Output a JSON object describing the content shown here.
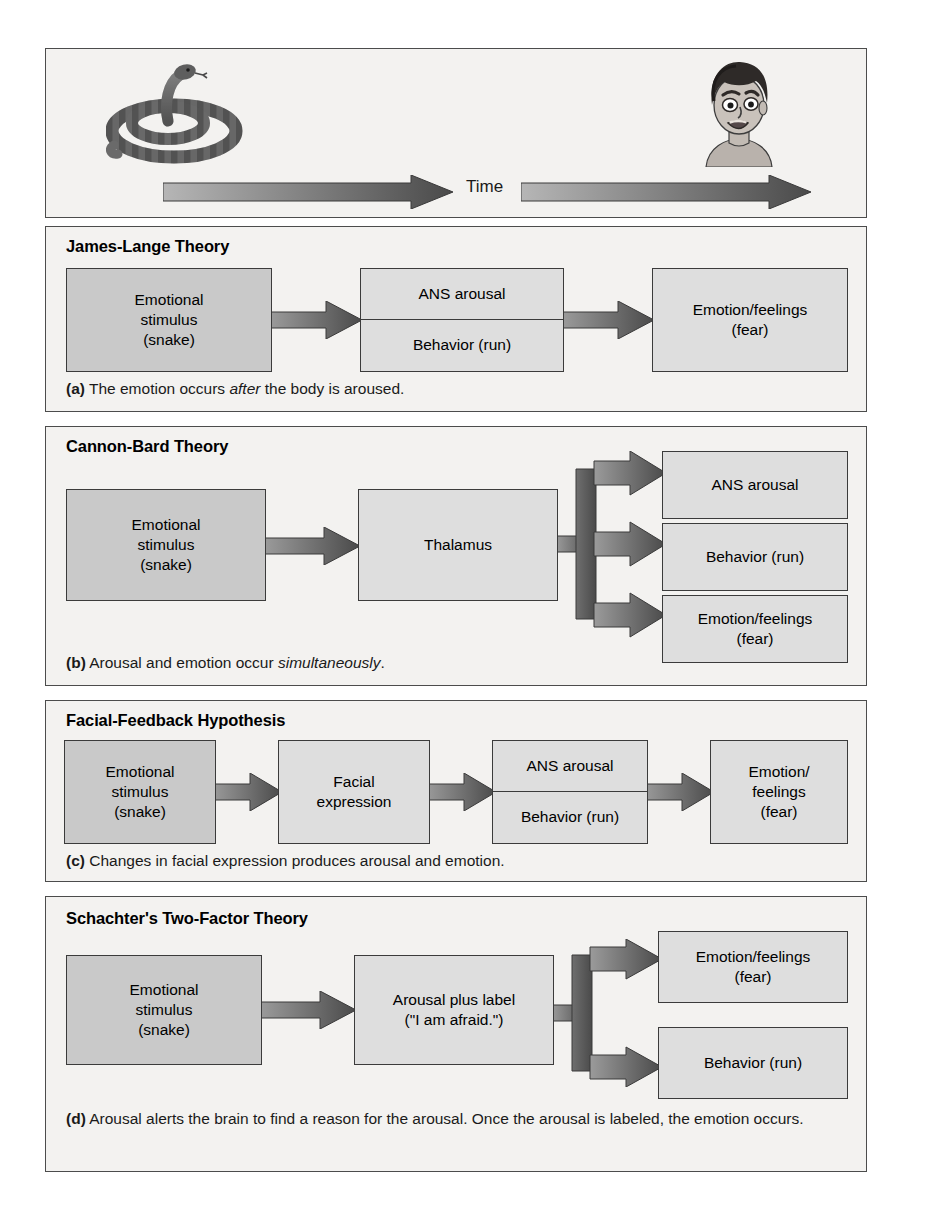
{
  "figure": {
    "timeline": {
      "time_label": "Time",
      "stimulus_icon": "snake-illustration",
      "response_icon": "frightened-face-illustration"
    },
    "panels": [
      {
        "id": "james-lange",
        "title": "James-Lange Theory",
        "caption_marker": "(a)",
        "caption_pre": " The emotion occurs ",
        "caption_em": "after",
        "caption_post": " the body is aroused.",
        "boxes": [
          {
            "name": "emotional-stimulus",
            "lines": [
              "Emotional",
              "stimulus",
              "(snake)"
            ]
          },
          {
            "name": "ans-arousal-behavior",
            "lines": [
              "ANS arousal",
              "Behavior (run)"
            ]
          },
          {
            "name": "emotion-feelings",
            "lines": [
              "Emotion/feelings",
              "(fear)"
            ]
          }
        ]
      },
      {
        "id": "cannon-bard",
        "title": "Cannon-Bard Theory",
        "caption_marker": "(b)",
        "caption_pre": " Arousal and emotion occur ",
        "caption_em": "simultaneously",
        "caption_post": ".",
        "boxes": [
          {
            "name": "emotional-stimulus",
            "lines": [
              "Emotional",
              "stimulus",
              "(snake)"
            ]
          },
          {
            "name": "thalamus",
            "lines": [
              "Thalamus"
            ]
          },
          {
            "name": "ans-arousal",
            "lines": [
              "ANS arousal"
            ]
          },
          {
            "name": "behavior",
            "lines": [
              "Behavior (run)"
            ]
          },
          {
            "name": "emotion-feelings",
            "lines": [
              "Emotion/feelings",
              "(fear)"
            ]
          }
        ]
      },
      {
        "id": "facial-feedback",
        "title": "Facial-Feedback Hypothesis",
        "caption_marker": "(c)",
        "caption_pre": " Changes in facial expression produces arousal and emotion.",
        "caption_em": "",
        "caption_post": "",
        "boxes": [
          {
            "name": "emotional-stimulus",
            "lines": [
              "Emotional",
              "stimulus",
              "(snake)"
            ]
          },
          {
            "name": "facial-expression",
            "lines": [
              "Facial",
              "expression"
            ]
          },
          {
            "name": "ans-arousal-behavior",
            "lines": [
              "ANS arousal",
              "Behavior (run)"
            ]
          },
          {
            "name": "emotion-feelings",
            "lines": [
              "Emotion/",
              "feelings",
              "(fear)"
            ]
          }
        ]
      },
      {
        "id": "schachter-two-factor",
        "title": "Schachter's Two-Factor Theory",
        "caption_marker": "(d)",
        "caption_pre": " Arousal alerts the brain to find a reason for the arousal. Once the arousal is labeled, the emotion occurs.",
        "caption_em": "",
        "caption_post": "",
        "boxes": [
          {
            "name": "emotional-stimulus",
            "lines": [
              "Emotional",
              "stimulus",
              "(snake)"
            ]
          },
          {
            "name": "arousal-plus-label",
            "lines": [
              "Arousal plus label",
              "(\"I am afraid.\")"
            ]
          },
          {
            "name": "emotion-feelings",
            "lines": [
              "Emotion/feelings",
              "(fear)"
            ]
          },
          {
            "name": "behavior",
            "lines": [
              "Behavior (run)"
            ]
          }
        ]
      }
    ]
  },
  "text": {
    "james_lange": {
      "title": "James-Lange Theory",
      "b1l1": "Emotional",
      "b1l2": "stimulus",
      "b1l3": "(snake)",
      "b2l1": "ANS arousal",
      "b2l2": "Behavior (run)",
      "b3l1": "Emotion/feelings",
      "b3l2": "(fear)",
      "cap_marker": "(a)",
      "cap_pre": " The emotion occurs ",
      "cap_em": "after",
      "cap_post": " the body is aroused."
    },
    "cannon_bard": {
      "title": "Cannon-Bard Theory",
      "b1l1": "Emotional",
      "b1l2": "stimulus",
      "b1l3": "(snake)",
      "b2l1": "Thalamus",
      "b3l1": "ANS arousal",
      "b4l1": "Behavior (run)",
      "b5l1": "Emotion/feelings",
      "b5l2": "(fear)",
      "cap_marker": "(b)",
      "cap_pre": " Arousal and emotion occur ",
      "cap_em": "simultaneously",
      "cap_post": "."
    },
    "facial_feedback": {
      "title": "Facial-Feedback Hypothesis",
      "b1l1": "Emotional",
      "b1l2": "stimulus",
      "b1l3": "(snake)",
      "b2l1": "Facial",
      "b2l2": "expression",
      "b3l1": "ANS arousal",
      "b3l2": "Behavior (run)",
      "b4l1": "Emotion/",
      "b4l2": "feelings",
      "b4l3": "(fear)",
      "cap_marker": "(c)",
      "cap_pre": " Changes in facial expression produces arousal and emotion."
    },
    "schachter": {
      "title": "Schachter's Two-Factor Theory",
      "b1l1": "Emotional",
      "b1l2": "stimulus",
      "b1l3": "(snake)",
      "b2l1": "Arousal plus label",
      "b2l2": "(\"I am afraid.\")",
      "b3l1": "Emotion/feelings",
      "b3l2": "(fear)",
      "b4l1": "Behavior (run)",
      "cap_marker": "(d)",
      "cap_pre": " Arousal alerts the brain to find a reason for the arousal. Once the arousal is labeled, the emotion occurs."
    },
    "timeline": {
      "time": "Time"
    }
  },
  "colors": {
    "panel_bg": "#f3f2f0",
    "panel_border": "#4c4c4c",
    "box_dark": "#d2d2d2",
    "box_light": "#dedede",
    "box_border": "#3b3b3b",
    "arrow_dark": "#4a4a4a",
    "arrow_light": "#a9a9a9",
    "text": "#000000"
  }
}
